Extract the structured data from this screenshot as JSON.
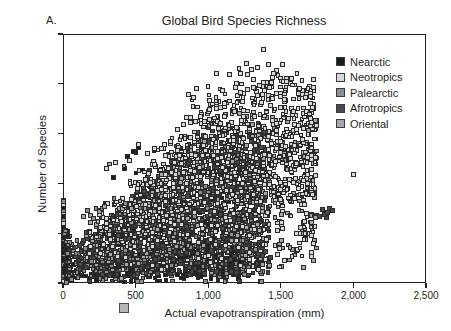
{
  "panel": {
    "label": "A."
  },
  "title": "Global Bird Species Richness",
  "axes": {
    "x_title": "Actual evapotranspiration (mm)",
    "y_title": "Number of Species",
    "x_ticks": [
      "0",
      "500",
      "1,000",
      "1,500",
      "2,000",
      "2,500"
    ],
    "y_ticks": [
      "0",
      "200",
      "400",
      "600",
      "800",
      "1,000"
    ]
  },
  "legend": {
    "items": [
      {
        "label": "Nearctic",
        "color": "#1c1c1c"
      },
      {
        "label": "Neotropics",
        "color": "#d8d8d8"
      },
      {
        "label": "Palearctic",
        "color": "#8e8e8e"
      },
      {
        "label": "Afrotropics",
        "color": "#4a4a4a"
      },
      {
        "label": "Oriental",
        "color": "#a8a8a8"
      }
    ]
  },
  "chart_data": {
    "type": "scatter",
    "title": "Global Bird Species Richness",
    "xlabel": "Actual evapotranspiration (mm)",
    "ylabel": "Number of Species",
    "xlim": [
      0,
      2500
    ],
    "ylim": [
      0,
      1000
    ],
    "xticks": [
      0,
      500,
      1000,
      1500,
      2000,
      2500
    ],
    "yticks": [
      0,
      200,
      400,
      600,
      800,
      1000
    ],
    "grid": false,
    "legend_position": "right",
    "marker": "square-outlined",
    "series": [
      {
        "name": "Nearctic",
        "color": "#1c1c1c",
        "n_points": 620,
        "x_range": [
          0,
          1250
        ],
        "y_range": [
          0,
          560
        ],
        "description": "Dense dark band from low AET up to ~1200 mm, richness mostly 20-350, tapering upward to ~560"
      },
      {
        "name": "Neotropics",
        "color": "#d8d8d8",
        "n_points": 900,
        "x_range": [
          100,
          2000
        ],
        "y_range": [
          60,
          940
        ],
        "description": "Light-gray cloud rising strongly; highest richness values 700-940 between 1000-1700 mm; single far outlier near 2000 mm / 435 species"
      },
      {
        "name": "Palearctic",
        "color": "#8e8e8e",
        "n_points": 780,
        "x_range": [
          0,
          1400
        ],
        "y_range": [
          10,
          620
        ],
        "description": "Mid-gray points spread broadly at low-to-mid AET, richness 10-400 typical"
      },
      {
        "name": "Afrotropics",
        "color": "#4a4a4a",
        "n_points": 760,
        "x_range": [
          0,
          1850
        ],
        "y_range": [
          20,
          700
        ],
        "description": "Dark-gray core overlapping the main cloud; isolated clump near 1750-1850 mm at 270-300 species"
      },
      {
        "name": "Oriental",
        "color": "#a8a8a8",
        "n_points": 430,
        "x_range": [
          150,
          1800
        ],
        "y_range": [
          70,
          760
        ],
        "description": "Light-mid gray points concentrated 800-1700 mm at 250-600 species"
      }
    ],
    "notes": [
      "Positive, saturating relationship between actual evapotranspiration and bird species richness",
      "Maximum observed richness ~940 species near 1,380 mm AET",
      "Dense low-richness band (<200 species) at AET below ~1,200 mm",
      "A stray light-gray marker is printed below the x-axis near 500 mm"
    ]
  }
}
